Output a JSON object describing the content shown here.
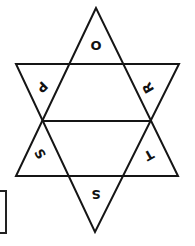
{
  "diagram": {
    "title": "",
    "shape": "hexagram-net",
    "stroke_color": "#151515",
    "background": "#ffffff",
    "faces": [
      {
        "id": "top",
        "label": "O",
        "x": 96,
        "y": 45,
        "rotate": 0
      },
      {
        "id": "upper-left",
        "label": "P",
        "x": 42,
        "y": 87,
        "rotate": 135
      },
      {
        "id": "upper-right",
        "label": "R",
        "x": 148,
        "y": 88,
        "rotate": -120
      },
      {
        "id": "lower-left",
        "label": "S",
        "x": 40,
        "y": 154,
        "rotate": 60
      },
      {
        "id": "lower-right",
        "label": "T",
        "x": 149,
        "y": 155,
        "rotate": 150
      },
      {
        "id": "bottom",
        "label": "S",
        "x": 96,
        "y": 194,
        "rotate": 180
      }
    ],
    "answer_box": {
      "value": ""
    }
  }
}
